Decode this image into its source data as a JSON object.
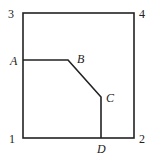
{
  "diagram": {
    "corners": {
      "c1": {
        "label": "1",
        "x": 23,
        "y": 138
      },
      "c2": {
        "label": "2",
        "x": 134,
        "y": 138
      },
      "c3": {
        "label": "3",
        "x": 23,
        "y": 13
      },
      "c4": {
        "label": "4",
        "x": 134,
        "y": 13
      }
    },
    "points": {
      "A": {
        "label": "A",
        "x": 23,
        "y": 60
      },
      "B": {
        "label": "B",
        "x": 68,
        "y": 60
      },
      "C": {
        "label": "C",
        "x": 101,
        "y": 97
      },
      "D": {
        "label": "D",
        "x": 101,
        "y": 138
      }
    },
    "stroke_color": "#222222"
  }
}
